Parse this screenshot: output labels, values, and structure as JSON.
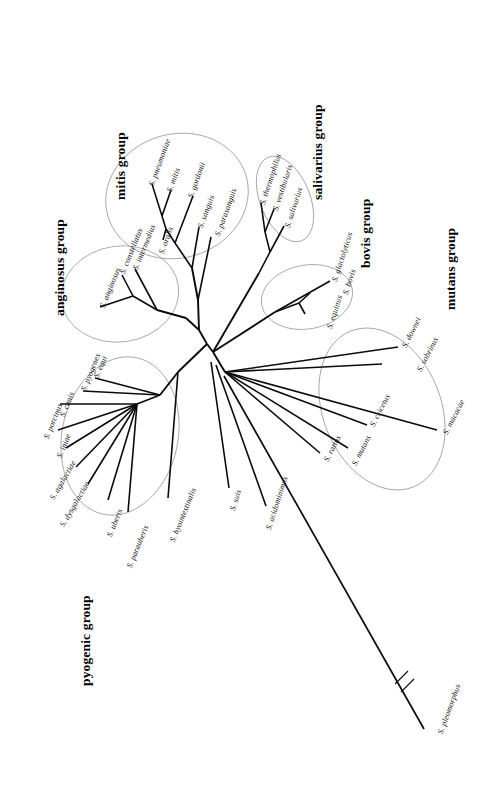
{
  "figure": {
    "type": "phylogenetic-tree",
    "layout": "unrooted-radial",
    "orientation": "rotated-90-clockwise",
    "background_color": "#ffffff",
    "line_color": "#0b0b0f",
    "ellipse_color": "#8d8d93"
  },
  "groups": [
    {
      "id": "anginosus",
      "label": "anginosus group"
    },
    {
      "id": "mitis",
      "label": "mitis group"
    },
    {
      "id": "salivarius",
      "label": "salivarius group"
    },
    {
      "id": "bovis",
      "label": "bovis group"
    },
    {
      "id": "mutans",
      "label": "mutans group"
    },
    {
      "id": "pyogenic",
      "label": "pyogenic group"
    }
  ],
  "taxa": {
    "mitis": [
      {
        "name": "S. pneumoniae"
      },
      {
        "name": "S. mitis"
      },
      {
        "name": "S. gordonii"
      },
      {
        "name": "S. oralis"
      },
      {
        "name": "S. sanguis"
      },
      {
        "name": "S. parasanguis"
      }
    ],
    "anginosus": [
      {
        "name": "S. constellatus"
      },
      {
        "name": "S. intermedius"
      },
      {
        "name": "S. anginosus"
      }
    ],
    "salivarius": [
      {
        "name": "S. thermophilus"
      },
      {
        "name": "S. vestibularis"
      },
      {
        "name": "S. salivarius"
      }
    ],
    "bovis": [
      {
        "name": "S. glactolyticus"
      },
      {
        "name": "S. bovis"
      },
      {
        "name": "S. equinus"
      }
    ],
    "mutans": [
      {
        "name": "S. downei"
      },
      {
        "name": "S. sobrinus"
      },
      {
        "name": "S. cricetus"
      },
      {
        "name": "S. mutans"
      },
      {
        "name": "S. rattus"
      },
      {
        "name": "S. macacae"
      }
    ],
    "pyogenic": [
      {
        "name": "S. pyogenes"
      },
      {
        "name": "S. equi"
      },
      {
        "name": "S. canis"
      },
      {
        "name": "S. porcinus"
      },
      {
        "name": "S. iniae"
      },
      {
        "name": "S. agalactiae"
      },
      {
        "name": "S. dysgalactiae"
      },
      {
        "name": "S. uberis"
      },
      {
        "name": "S. parauberis"
      },
      {
        "name": "S. hyointestinalis"
      }
    ],
    "ungrouped": [
      {
        "name": "S. suis"
      },
      {
        "name": "S. acidominimus"
      },
      {
        "name": "S. pleomorphus"
      }
    ]
  },
  "annotations": {
    "branch_break": "//"
  }
}
